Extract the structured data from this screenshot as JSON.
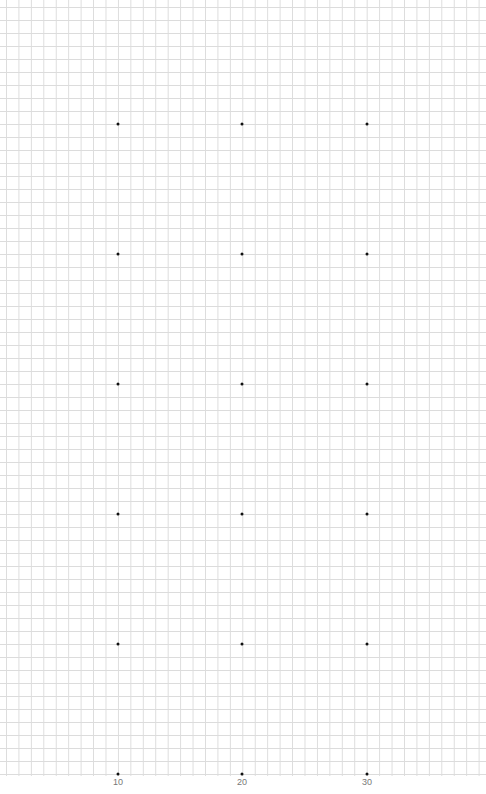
{
  "canvas": {
    "grid_color": "#dcdcdc",
    "dot_color": "#111111",
    "background": "#ffffff"
  },
  "x_labels": [
    {
      "text": "10",
      "x": 118
    },
    {
      "text": "20",
      "x": 242
    },
    {
      "text": "30",
      "x": 367
    }
  ],
  "dot_columns_x": [
    118,
    242,
    367
  ],
  "dot_rows_y": [
    124,
    254,
    384,
    514,
    644,
    774
  ]
}
